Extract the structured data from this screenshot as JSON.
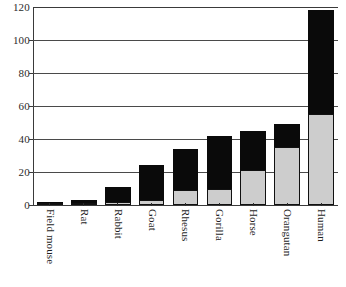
{
  "chart_data": {
    "type": "bar",
    "stacked": true,
    "title": "",
    "xlabel": "",
    "ylabel": "",
    "ylim": [
      0,
      120
    ],
    "yticks": [
      0,
      20,
      40,
      60,
      80,
      100,
      120
    ],
    "ytick_labels": [
      "0",
      "20",
      "40",
      "60",
      "80",
      "100",
      "120"
    ],
    "grid": true,
    "legend": "none",
    "orientation": "vertical",
    "x_label_rotation": 90,
    "categories": [
      "Field mouse",
      "Rat",
      "Rabbit",
      "Goat",
      "Rhesus",
      "Gorilla",
      "Horse",
      "Orangutan",
      "Human"
    ],
    "series": [
      {
        "name": "lower-segment",
        "color": "#cdcdcd",
        "values": [
          1,
          1,
          2,
          3,
          9,
          10,
          21,
          35,
          55
        ]
      },
      {
        "name": "upper-segment",
        "color": "#0a0a0a",
        "values": [
          1,
          2,
          9,
          21,
          25,
          32,
          24,
          14,
          63
        ]
      }
    ],
    "totals": [
      2,
      3,
      11,
      24,
      34,
      42,
      45,
      49,
      118
    ]
  },
  "axes": {
    "y_axis_name": "y-axis",
    "x_axis_name": "x-axis"
  }
}
